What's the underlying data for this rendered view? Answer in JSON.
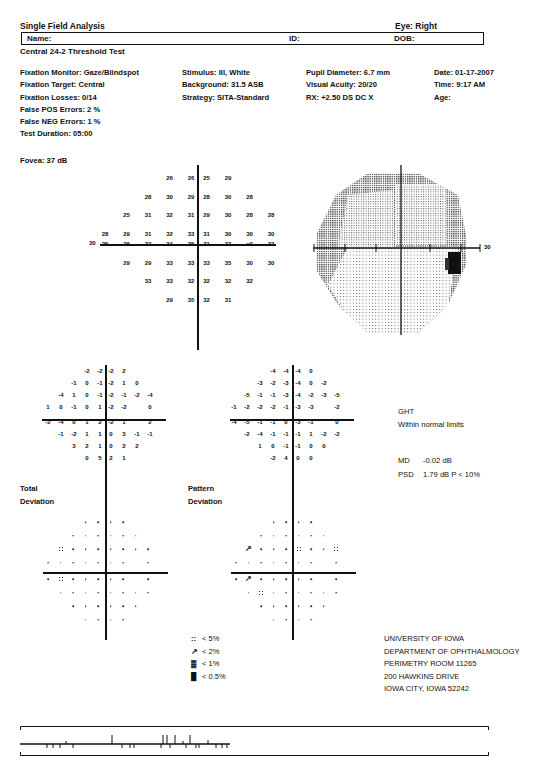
{
  "header": {
    "title": "Single Field Analysis",
    "eye": "Eye: Right",
    "name_label": "Name:",
    "id_label": "ID:",
    "dob_label": "DOB:",
    "test_name": "Central 24-2 Threshold Test"
  },
  "info": {
    "col1": [
      "Fixation Monitor: Gaze/Blindspot",
      "Fixation Target: Central",
      "Fixation Losses: 0/14",
      "False POS Errors:  2 %",
      "False NEG Errors:  1 %",
      "Test Duration: 05:00"
    ],
    "col2": [
      "Stimulus: III, White",
      "Background: 31.5 ASB",
      "Strategy: SITA-Standard"
    ],
    "col3": [
      "Pupil Diameter: 6.7 mm",
      "Visual Acuity: 20/20",
      "RX: +2.50 DS      DC  X"
    ],
    "col4": [
      "Date: 01-17-2007",
      "Time:  9:17 AM",
      "Age:"
    ],
    "fovea": "Fovea: 37 dB"
  },
  "threshold": {
    "axis_label": "30",
    "rows": [
      [
        "",
        "",
        "",
        "26",
        "26",
        "25",
        "29",
        "",
        "",
        ""
      ],
      [
        "",
        "",
        "28",
        "30",
        "29",
        "28",
        "30",
        "28",
        "",
        ""
      ],
      [
        "",
        "25",
        "31",
        "32",
        "31",
        "29",
        "30",
        "28",
        "28",
        ""
      ],
      [
        "28",
        "29",
        "31",
        "32",
        "33",
        "31",
        "30",
        "30",
        "30",
        ""
      ],
      [
        "25",
        "26",
        "32",
        "34",
        "35",
        "31",
        "33",
        "<0",
        "32",
        ""
      ],
      [
        "",
        "29",
        "29",
        "33",
        "33",
        "33",
        "35",
        "30",
        "30",
        ""
      ],
      [
        "",
        "",
        "33",
        "33",
        "32",
        "32",
        "32",
        "32",
        "",
        ""
      ],
      [
        "",
        "",
        "",
        "29",
        "35",
        "32",
        "31",
        "",
        "",
        ""
      ]
    ]
  },
  "grayscale": {
    "axis_label": "30"
  },
  "total_deviation": {
    "label_line1": "Total",
    "label_line2": "Deviation",
    "rows": [
      [
        "",
        "",
        "",
        "-2",
        "-2",
        "-2",
        "2",
        "",
        "",
        ""
      ],
      [
        "",
        "",
        "-1",
        "0",
        "-1",
        "-2",
        "1",
        "0",
        "",
        ""
      ],
      [
        "",
        "-4",
        "1",
        "0",
        "-1",
        "-2",
        "-1",
        "-2",
        "-4",
        ""
      ],
      [
        "1",
        "0",
        "-1",
        "0",
        "1",
        "-2",
        "-2",
        "",
        "0",
        ""
      ],
      [
        "-2",
        "-4",
        "0",
        "1",
        "2",
        "-2",
        "1",
        "",
        "2",
        ""
      ],
      [
        "",
        "-1",
        "-2",
        "1",
        "1",
        "0",
        "3",
        "-1",
        "-1",
        ""
      ],
      [
        "",
        "",
        "3",
        "2",
        "1",
        "0",
        "2",
        "2",
        "",
        ""
      ],
      [
        "",
        "",
        "",
        "0",
        "5",
        "2",
        "1",
        "",
        "",
        ""
      ]
    ]
  },
  "pattern_deviation": {
    "label_line1": "Pattern",
    "label_line2": "Deviation",
    "rows": [
      [
        "",
        "",
        "",
        "-4",
        "-4",
        "-4",
        "0",
        "",
        "",
        ""
      ],
      [
        "",
        "",
        "-3",
        "-2",
        "-3",
        "-4",
        "0",
        "-2",
        "",
        ""
      ],
      [
        "",
        "-5",
        "-1",
        "-1",
        "-3",
        "-4",
        "-2",
        "-3",
        "-5",
        ""
      ],
      [
        "-1",
        "-2",
        "-2",
        "-2",
        "-1",
        "-3",
        "-3",
        "",
        "-2",
        ""
      ],
      [
        "-4",
        "-5",
        "-1",
        "-1",
        "0",
        "-3",
        "-1",
        "",
        "0",
        ""
      ],
      [
        "",
        "-2",
        "-4",
        "-1",
        "-1",
        "-1",
        "1",
        "-2",
        "-2",
        ""
      ],
      [
        "",
        "",
        "1",
        "0",
        "-1",
        "-1",
        "0",
        "0",
        "",
        ""
      ],
      [
        "",
        "",
        "",
        "-2",
        "4",
        "0",
        "0",
        "",
        "",
        ""
      ]
    ]
  },
  "indices": {
    "ght_label": "GHT",
    "ght_value": "Within normal limits",
    "md_label": "MD",
    "md_value": "-0.02 dB",
    "psd_label": "PSD",
    "psd_value": "1.79 dB  P < 10%"
  },
  "total_prob": {
    "rows": [
      [
        "",
        "",
        "",
        ".",
        ".",
        ".",
        ".",
        "",
        "",
        ""
      ],
      [
        "",
        "",
        ".",
        ".",
        ".",
        ".",
        ".",
        ".",
        "",
        ""
      ],
      [
        "",
        "5",
        ".",
        ".",
        ".",
        ".",
        ".",
        ".",
        ".",
        ""
      ],
      [
        ".",
        ".",
        ".",
        ".",
        ".",
        ".",
        ".",
        "",
        ".",
        ""
      ],
      [
        ".",
        "5",
        ".",
        ".",
        ".",
        ".",
        ".",
        "",
        ".",
        ""
      ],
      [
        "",
        ".",
        ".",
        ".",
        ".",
        ".",
        ".",
        ".",
        ".",
        ""
      ],
      [
        "",
        "",
        ".",
        ".",
        ".",
        ".",
        ".",
        ".",
        "",
        ""
      ],
      [
        "",
        "",
        "",
        ".",
        ".",
        ".",
        ".",
        "",
        "",
        ""
      ]
    ]
  },
  "pattern_prob": {
    "rows": [
      [
        "",
        "",
        "",
        ".",
        ".",
        ".",
        ".",
        "",
        "",
        ""
      ],
      [
        "",
        "",
        ".",
        ".",
        ".",
        ".",
        ".",
        ".",
        "",
        ""
      ],
      [
        "",
        "2",
        ".",
        ".",
        ".",
        "5",
        ".",
        ".",
        "5",
        ""
      ],
      [
        ".",
        ".",
        ".",
        ".",
        ".",
        ".",
        ".",
        "",
        ".",
        ""
      ],
      [
        ".",
        "2",
        ".",
        ".",
        ".",
        ".",
        ".",
        "",
        ".",
        ""
      ],
      [
        "",
        ".",
        "5",
        ".",
        ".",
        ".",
        ".",
        ".",
        ".",
        ""
      ],
      [
        "",
        "",
        ".",
        ".",
        ".",
        ".",
        ".",
        ".",
        "",
        ""
      ],
      [
        "",
        "",
        "",
        ".",
        ".",
        ".",
        ".",
        "",
        "",
        ""
      ]
    ]
  },
  "legend": {
    "items": [
      {
        "symbol": "::",
        "label": "< 5%"
      },
      {
        "symbol": "↗",
        "label": "< 2%"
      },
      {
        "symbol": "▓",
        "label": "< 1%"
      },
      {
        "symbol": "█",
        "label": "< 0.5%"
      }
    ]
  },
  "address": [
    "UNIVERSITY OF IOWA",
    "DEPARTMENT OF OPHTHALMOLOGY",
    "PERIMETRY ROOM 11265",
    "200 HAWKINS DRIVE",
    "IOWA CITY, IOWA 52242"
  ],
  "colors": {
    "ink": "#111111",
    "paper": "#ffffff"
  }
}
